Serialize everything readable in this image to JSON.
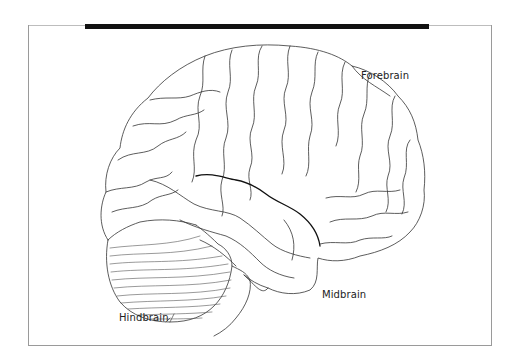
{
  "diagram": {
    "labels": {
      "forebrain": "Forebrain",
      "midbrain": "Midbrain",
      "hindbrain": "Hindbrain"
    },
    "colors": {
      "line": "#333333",
      "bar": "#111111",
      "frame": "#9a9a9a",
      "background": "#ffffff"
    }
  }
}
